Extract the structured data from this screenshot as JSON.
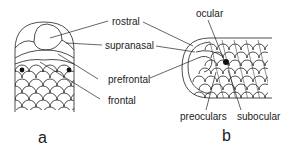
{
  "figure": {
    "panels": [
      {
        "id": "a",
        "label": "a",
        "view": "dorsal"
      },
      {
        "id": "b",
        "label": "b",
        "view": "lateral"
      }
    ],
    "labels": {
      "rostral": "rostral",
      "supranasal": "supranasal",
      "prefrontal": "prefrontal",
      "frontal": "frontal",
      "ocular": "ocular",
      "preoculars": "preoculars",
      "subocular": "subocular"
    },
    "colors": {
      "line": "#222222",
      "background": "#ffffff"
    }
  }
}
